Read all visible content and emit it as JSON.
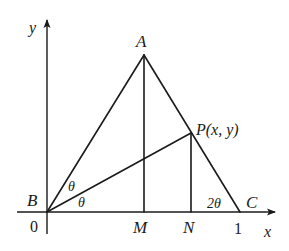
{
  "diagram": {
    "type": "geometry",
    "axes": {
      "x_label": "x",
      "y_label": "y",
      "origin_label": "0",
      "x_tick_label": "1"
    },
    "points": {
      "A": "A",
      "B": "B",
      "C": "C",
      "M": "M",
      "N": "N",
      "P": "P(x, y)"
    },
    "angles": {
      "upper_theta": "θ",
      "lower_theta": "θ",
      "angle_c": "2θ"
    },
    "colors": {
      "ink": "#1a1a1a",
      "background": "#ffffff"
    }
  }
}
